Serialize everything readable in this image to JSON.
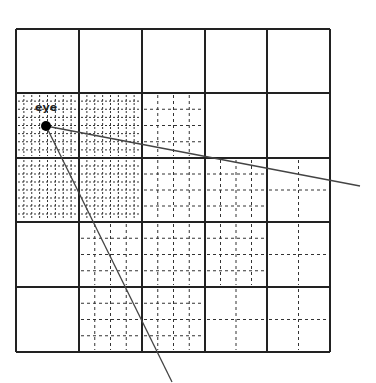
{
  "diagram": {
    "eye_label": "eye",
    "grid": {
      "rows": 5,
      "cols": 5,
      "x_lines": [
        16,
        79,
        142,
        205,
        267,
        330
      ],
      "y_lines": [
        29,
        93,
        158,
        222,
        287,
        352
      ],
      "subdivisions": [
        [
          1,
          1,
          1,
          1,
          1
        ],
        [
          8,
          8,
          4,
          1,
          1
        ],
        [
          8,
          8,
          4,
          4,
          2
        ],
        [
          1,
          4,
          4,
          4,
          2
        ],
        [
          1,
          4,
          4,
          2,
          2
        ]
      ]
    },
    "eye": {
      "x": 46,
      "y": 126,
      "radius": 5
    },
    "rays": [
      {
        "name": "view-ray-right",
        "x2": 360,
        "y2": 186
      },
      {
        "name": "view-ray-down",
        "x2": 172,
        "y2": 382
      }
    ],
    "colors": {
      "grid_line": "#222222",
      "sub_line": "#333333",
      "ray": "#444444",
      "eye": "#000000"
    }
  }
}
